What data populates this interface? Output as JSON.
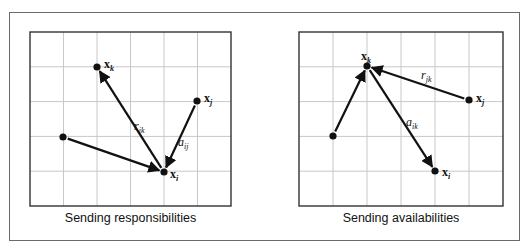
{
  "figure": {
    "panels": [
      {
        "id": "left",
        "caption": "Sending responsibilities",
        "grid": {
          "x0": 30,
          "y0": 32,
          "cols": 6,
          "rows": 5,
          "cell_w": 33.5,
          "cell_h": 34.8
        },
        "points": [
          {
            "id": "xk",
            "x": 97,
            "y": 67,
            "label": "x",
            "sub": "k",
            "lx": 104,
            "ly": 68
          },
          {
            "id": "xj",
            "x": 197,
            "y": 101,
            "label": "x",
            "sub": "j",
            "lx": 204,
            "ly": 102
          },
          {
            "id": "xi",
            "x": 164,
            "y": 172,
            "label": "x",
            "sub": "i",
            "lx": 170,
            "ly": 178
          },
          {
            "id": "xo",
            "x": 63,
            "y": 137,
            "label": "",
            "sub": ""
          }
        ],
        "edges": [
          {
            "from": "xi",
            "to": "xk",
            "label": "r",
            "sub": "ik",
            "lx": 134,
            "ly": 130
          },
          {
            "from": "xj",
            "to": "xi",
            "label": "a",
            "sub": "ij",
            "lx": 178,
            "ly": 146
          },
          {
            "from": "xo",
            "to": "xi",
            "label": "",
            "sub": ""
          }
        ]
      },
      {
        "id": "right",
        "caption": "Sending availabilities",
        "grid": {
          "x0": 299,
          "y0": 32,
          "cols": 6,
          "rows": 5,
          "cell_w": 34,
          "cell_h": 34.8
        },
        "points": [
          {
            "id": "xk",
            "x": 367,
            "y": 66,
            "label": "x",
            "sub": "k",
            "lx": 361,
            "ly": 60
          },
          {
            "id": "xj",
            "x": 469,
            "y": 100,
            "label": "x",
            "sub": "j",
            "lx": 476,
            "ly": 102
          },
          {
            "id": "xi",
            "x": 435,
            "y": 171,
            "label": "x",
            "sub": "i",
            "lx": 442,
            "ly": 176
          },
          {
            "id": "xo",
            "x": 333,
            "y": 136,
            "label": "",
            "sub": ""
          }
        ],
        "edges": [
          {
            "from": "xj",
            "to": "xk",
            "label": "r",
            "sub": "jk",
            "lx": 421,
            "ly": 79
          },
          {
            "from": "xk",
            "to": "xi",
            "label": "a",
            "sub": "ik",
            "lx": 406,
            "ly": 126
          },
          {
            "from": "xo",
            "to": "xk",
            "label": "",
            "sub": ""
          }
        ]
      }
    ],
    "colors": {
      "frame": "#6a6a6a",
      "grid": "#c8c8c8",
      "grid_border": "#333333",
      "ink": "#111111"
    }
  }
}
